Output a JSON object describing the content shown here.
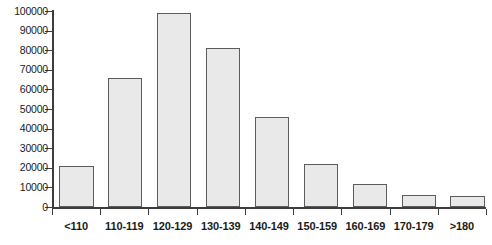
{
  "chart_data": {
    "type": "bar",
    "title": "",
    "xlabel": "",
    "ylabel": "",
    "categories": [
      "<110",
      "110-119",
      "120-129",
      "130-139",
      "140-149",
      "150-159",
      "160-169",
      "170-179",
      ">180"
    ],
    "values": [
      21000,
      66000,
      99000,
      81000,
      46000,
      22000,
      11500,
      6000,
      5600
    ],
    "ylim": [
      0,
      100000
    ],
    "yticks": [
      0,
      10000,
      20000,
      30000,
      40000,
      50000,
      60000,
      70000,
      80000,
      90000,
      100000
    ],
    "ytick_labels": [
      "0",
      "10000",
      "20000",
      "30000",
      "40000",
      "50000",
      "60000",
      "70000",
      "80000",
      "90000",
      "100000"
    ],
    "grid": false,
    "legend": false,
    "bar_fill_color": "#e9e9e9",
    "bar_border_color": "#5c5c5c",
    "axis_color": "#3d3d3d",
    "background_color": "#ffffff"
  }
}
